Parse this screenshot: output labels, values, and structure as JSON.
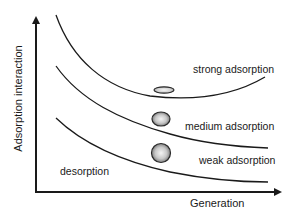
{
  "diagram": {
    "axes": {
      "x_label": "Generation",
      "y_label": "Adsorption interaction"
    },
    "regions": [
      {
        "label": "strong adsorption",
        "particle": "flattened-ellipse"
      },
      {
        "label": "medium adsorption",
        "particle": "oblate-sphere"
      },
      {
        "label": "weak adsorption",
        "particle": "sphere"
      },
      {
        "label": "desorption",
        "particle": "none"
      }
    ],
    "curves": 3,
    "colors": {
      "line": "#1a1a1a",
      "particle_edge": "#2a2a2a",
      "particle_fill_light": "#f2f2f2",
      "particle_fill_dark": "#7a7a7a",
      "background": "#ffffff"
    }
  }
}
